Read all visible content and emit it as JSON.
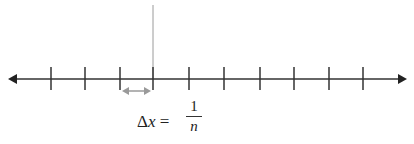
{
  "diagram": {
    "type": "number-line",
    "axis": {
      "y": 79,
      "x_start": 8,
      "x_end": 408,
      "color": "#333333",
      "arrows": "both"
    },
    "ticks_x": [
      51,
      85,
      120,
      153,
      189,
      224,
      260,
      294,
      329,
      363
    ],
    "highlight_line": {
      "x": 153,
      "y_top": 5,
      "color": "#999999"
    },
    "interval_arrow": {
      "x1": 122,
      "x2": 151,
      "y": 91,
      "color": "#999999"
    },
    "label": {
      "lhs_symbol": "Δ",
      "lhs_var": "x",
      "equals": " = ",
      "numerator": "1",
      "denominator": "n"
    }
  }
}
